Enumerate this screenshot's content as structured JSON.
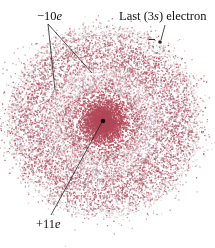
{
  "figure": {
    "labels": {
      "inner_electrons_charge": "−10",
      "inner_electrons_unit": "e",
      "last_electron_prefix": "Last (3",
      "last_electron_orbital": "s",
      "last_electron_suffix": ") electron",
      "last_electron_sign": "−",
      "nucleus_charge": "+11",
      "nucleus_unit": "e"
    },
    "colors": {
      "cloud": "#b24a5a",
      "ink": "#111111"
    }
  }
}
